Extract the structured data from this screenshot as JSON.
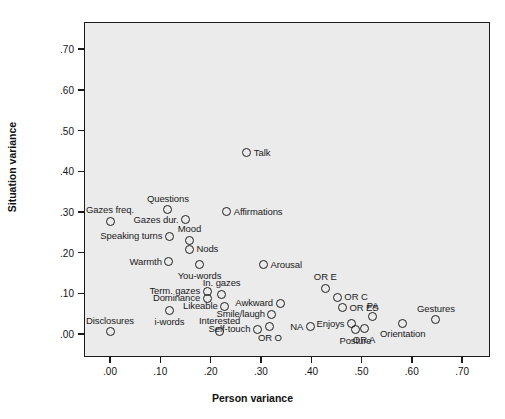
{
  "chart_data": {
    "type": "scatter",
    "title": "",
    "xlabel": "Person variance",
    "ylabel": "Situation variance",
    "xlim": [
      -0.045,
      0.745
    ],
    "ylim": [
      -0.035,
      0.787
    ],
    "xticks": [
      ".00",
      ".10",
      ".20",
      ".30",
      ".40",
      ".50",
      ".60",
      ".70"
    ],
    "xtickvalues": [
      0.0,
      0.1,
      0.2,
      0.3,
      0.4,
      0.5,
      0.6,
      0.7
    ],
    "yticks": [
      ".00",
      ".10",
      ".20",
      ".30",
      ".40",
      ".50",
      ".60",
      ".70"
    ],
    "ytickvalues": [
      0.0,
      0.1,
      0.2,
      0.3,
      0.4,
      0.5,
      0.6,
      0.7
    ],
    "grid": false,
    "legend": "none",
    "marker": {
      "shape": "open-circle",
      "edge_color": "#1d1d1d",
      "fill_color": "none",
      "size_px": 9
    },
    "plot_background": "#ebebeb",
    "frame_color": "#1b1b1b",
    "points": [
      {
        "label": "Talk",
        "x": 0.272,
        "y": 0.445,
        "label_pos": "right"
      },
      {
        "label": "Questions",
        "x": 0.115,
        "y": 0.305,
        "label_pos": "above"
      },
      {
        "label": "Affirmations",
        "x": 0.232,
        "y": 0.3,
        "label_pos": "right"
      },
      {
        "label": "Gazes freq.",
        "x": 0.0,
        "y": 0.277,
        "label_pos": "above"
      },
      {
        "label": "Gazes dur.",
        "x": 0.15,
        "y": 0.281,
        "label_pos": "left"
      },
      {
        "label": "Mood",
        "x": 0.158,
        "y": 0.23,
        "label_pos": "above"
      },
      {
        "label": "Speaking turns",
        "x": 0.118,
        "y": 0.24,
        "label_pos": "left"
      },
      {
        "label": "Nods",
        "x": 0.158,
        "y": 0.208,
        "label_pos": "right"
      },
      {
        "label": "Warmth",
        "x": 0.117,
        "y": 0.178,
        "label_pos": "left"
      },
      {
        "label": "You-words",
        "x": 0.178,
        "y": 0.17,
        "label_pos": "below"
      },
      {
        "label": "Arousal",
        "x": 0.305,
        "y": 0.17,
        "label_pos": "right"
      },
      {
        "label": "Term. gazes",
        "x": 0.193,
        "y": 0.105,
        "label_pos": "left"
      },
      {
        "label": "In. gazes",
        "x": 0.222,
        "y": 0.098,
        "label_pos": "above"
      },
      {
        "label": "OR E",
        "x": 0.428,
        "y": 0.112,
        "label_pos": "above"
      },
      {
        "label": "Dominance",
        "x": 0.193,
        "y": 0.088,
        "label_pos": "left"
      },
      {
        "label": "Awkward",
        "x": 0.338,
        "y": 0.075,
        "label_pos": "left"
      },
      {
        "label": "OR C",
        "x": 0.452,
        "y": 0.09,
        "label_pos": "right"
      },
      {
        "label": "Likeable",
        "x": 0.228,
        "y": 0.068,
        "label_pos": "left"
      },
      {
        "label": "i-words",
        "x": 0.118,
        "y": 0.057,
        "label_pos": "below"
      },
      {
        "label": "OR ES",
        "x": 0.462,
        "y": 0.065,
        "label_pos": "right"
      },
      {
        "label": "Smile/laugh",
        "x": 0.322,
        "y": 0.048,
        "label_pos": "left"
      },
      {
        "label": "PA",
        "x": 0.522,
        "y": 0.042,
        "label_pos": "above"
      },
      {
        "label": "Gestures",
        "x": 0.648,
        "y": 0.035,
        "label_pos": "above"
      },
      {
        "label": "Enjoys",
        "x": 0.48,
        "y": 0.025,
        "label_pos": "left"
      },
      {
        "label": "Interested",
        "x": 0.218,
        "y": 0.005,
        "label_pos": "above"
      },
      {
        "label": "Self-touch",
        "x": 0.293,
        "y": 0.012,
        "label_pos": "left"
      },
      {
        "label": "OR O",
        "x": 0.318,
        "y": 0.018,
        "label_pos": "below"
      },
      {
        "label": "NA",
        "x": 0.398,
        "y": 0.018,
        "label_pos": "left"
      },
      {
        "label": "Posture",
        "x": 0.488,
        "y": 0.01,
        "label_pos": "below"
      },
      {
        "label": "OR A",
        "x": 0.505,
        "y": 0.013,
        "label_pos": "below"
      },
      {
        "label": "Orientation",
        "x": 0.582,
        "y": 0.027,
        "label_pos": "below"
      },
      {
        "label": "Disclosures",
        "x": 0.0,
        "y": 0.005,
        "label_pos": "above"
      }
    ],
    "extra_label_offsets": {
      "OR ES": 0.0,
      "OR C": 0.0
    }
  }
}
